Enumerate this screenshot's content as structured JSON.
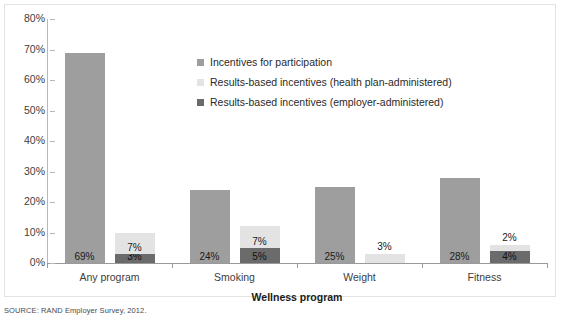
{
  "chart_data": {
    "type": "bar",
    "title": "",
    "xlabel": "Wellness program",
    "ylabel": "",
    "categories": [
      "Any program",
      "Smoking",
      "Weight",
      "Fitness"
    ],
    "ylim": [
      0,
      80
    ],
    "ytick_labels": [
      "80%",
      "70%",
      "60%",
      "50%",
      "40%",
      "30%",
      "20%",
      "10%",
      "0%"
    ],
    "ytick_values": [
      80,
      70,
      60,
      50,
      40,
      30,
      20,
      10,
      0
    ],
    "grid": false,
    "legend_position": "upper-center",
    "stacked_second_bar": true,
    "series": [
      {
        "name": "Incentives for participation",
        "color": "#9e9e9e",
        "values": [
          69,
          24,
          25,
          28
        ],
        "labels": [
          "69%",
          "24%",
          "25%",
          "28%"
        ]
      },
      {
        "name": "Results-based incentives (health plan-administered)",
        "color": "#e3e3e3",
        "values": [
          7,
          7,
          3,
          2
        ],
        "labels": [
          "7%",
          "7%",
          "3%",
          "2%"
        ]
      },
      {
        "name": "Results-based incentives (employer-administered)",
        "color": "#6b6b6b",
        "values": [
          3,
          5,
          0,
          4
        ],
        "labels": [
          "3%",
          "5%",
          "",
          "4%"
        ]
      }
    ]
  },
  "axis": {
    "x_title": "Wellness program"
  },
  "legend": {
    "items": [
      {
        "label": "Incentives for participation",
        "color": "#9e9e9e"
      },
      {
        "label": "Results-based incentives (health plan-administered)",
        "color": "#e3e3e3"
      },
      {
        "label": "Results-based incentives (employer-administered)",
        "color": "#6b6b6b"
      }
    ]
  },
  "source": {
    "note": "SOURCE: RAND Employer Survey, 2012."
  }
}
